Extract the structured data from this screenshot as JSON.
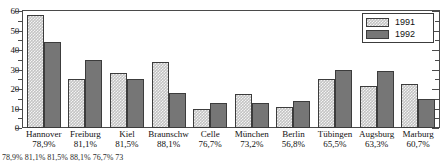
{
  "chart_data": {
    "type": "bar",
    "title": "",
    "subtitle": "",
    "xlabel": "",
    "ylabel": "",
    "ylim": [
      0,
      60
    ],
    "yticks": [
      0,
      10,
      20,
      30,
      40,
      50,
      60
    ],
    "ytick_labels": [
      "0",
      "10",
      "20",
      "30",
      "40",
      "50",
      "60"
    ],
    "minor_tick_step": 5,
    "grid": false,
    "legend_position": "top-right",
    "categories": [
      "Hannover",
      "Freiburg",
      "Kiel",
      "Braunschw",
      "Celle",
      "München",
      "Berlin",
      "Tübingen",
      "Augsburg",
      "Marburg"
    ],
    "category_percents": [
      "78,9%",
      "81,1%",
      "81,5%",
      "88,1%",
      "76,7%",
      "73,2%",
      "56,8%",
      "65,5%",
      "63,3%",
      "60,7%"
    ],
    "series": [
      {
        "name": "1991",
        "color": "#c3c3c3",
        "values": [
          58,
          25,
          28,
          34,
          10,
          17.5,
          11,
          25,
          21.5,
          22.5
        ]
      },
      {
        "name": "1992",
        "color": "#767676",
        "values": [
          44,
          35,
          25,
          18,
          13,
          13,
          14,
          30,
          29,
          15
        ]
      }
    ]
  },
  "legend": {
    "entries": [
      {
        "label": "1991"
      },
      {
        "label": "1992"
      }
    ]
  },
  "caption": {
    "text": "78,9%        81,1%        81,5%        88,1%        76,7%        73"
  }
}
